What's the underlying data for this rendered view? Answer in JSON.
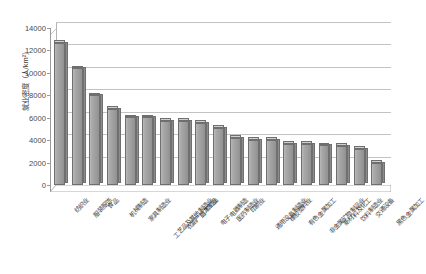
{
  "chart_data": {
    "type": "bar",
    "title": "",
    "xlabel": "",
    "ylabel": "就业密度（人/km²）",
    "ylim": [
      0,
      14000
    ],
    "ytick_step": 2000,
    "yticks": [
      "0",
      "2000",
      "4000",
      "6000",
      "8000",
      "10000",
      "12000",
      "14000"
    ],
    "grid": true,
    "legend": "none",
    "style": "3d-column",
    "bar_color": "#a3a3a3",
    "bar_border_color": "#6f6f6f",
    "categories": [
      "纺织业",
      "服装服饰",
      "食品",
      "机械制造",
      "家具制造业",
      "工艺品及其他制造业",
      "农副产品加工业",
      "竹木制品",
      "电子电器制造",
      "医药制造业",
      "印刷业",
      "通用设备制造业",
      "橡胶塑料业",
      "有色金属加工",
      "非金属矿物制品业",
      "新材料及化工",
      "饮料制造业",
      "交通设备",
      "黑色金属加工"
    ],
    "values": [
      12700,
      10400,
      8000,
      6800,
      6050,
      6050,
      5750,
      5750,
      5550,
      5100,
      4200,
      4050,
      4050,
      3700,
      3650,
      3550,
      3500,
      3250,
      2000
    ]
  }
}
